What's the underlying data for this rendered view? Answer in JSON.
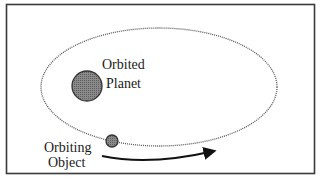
{
  "diagram": {
    "type": "orbit-diagram",
    "labels": {
      "planet_line1": "Orbited",
      "planet_line2": "Planet",
      "object_line1": "Orbiting",
      "object_line2": "Object"
    },
    "colors": {
      "frame": "#3a3a3a",
      "orbit": "#555555",
      "planet_fill": "#7a7a7a",
      "object_fill": "#7f7f7f",
      "arrow": "#111111"
    }
  }
}
